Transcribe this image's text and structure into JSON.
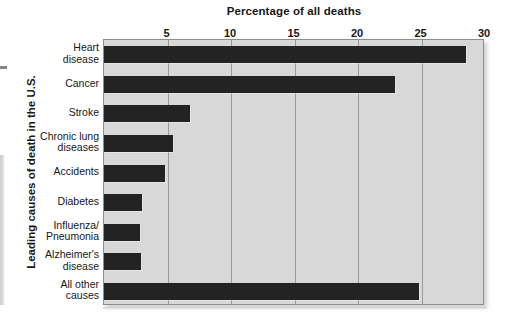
{
  "chart_data": {
    "type": "bar",
    "orientation": "horizontal",
    "title": "Percentage of all deaths",
    "xlabel": "Percentage of all deaths",
    "ylabel": "Leading causes of death in the U.S.",
    "xlim": [
      0,
      30
    ],
    "xticks": [
      5,
      10,
      15,
      20,
      25,
      30
    ],
    "xtick_labels": [
      "5",
      "10",
      "15",
      "20",
      "25",
      "30"
    ],
    "grid": true,
    "legend": "none",
    "bar_color": "#232323",
    "plot_background": "#d8d8d8",
    "categories": [
      "Heart disease",
      "Cancer",
      "Stroke",
      "Chronic lung diseases",
      "Accidents",
      "Diabetes",
      "Influenza/Pneumonia",
      "Alzheimer's disease",
      "All other causes"
    ],
    "category_label_lines": [
      [
        "Heart",
        "disease"
      ],
      [
        "Cancer"
      ],
      [
        "Stroke"
      ],
      [
        "Chronic lung",
        "diseases"
      ],
      [
        "Accidents"
      ],
      [
        "Diabetes"
      ],
      [
        "Influenza/",
        "Pneumonia"
      ],
      [
        "Alzheimer's",
        "disease"
      ],
      [
        "All other",
        "causes"
      ]
    ],
    "values": [
      28.5,
      22.9,
      6.8,
      5.4,
      4.8,
      3.0,
      2.8,
      2.9,
      24.8
    ]
  }
}
